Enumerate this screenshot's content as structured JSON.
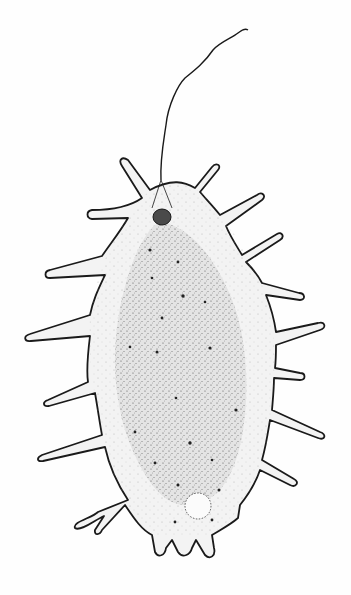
{
  "figure": {
    "colors": {
      "background": "#fefefe",
      "outline": "#1a1a1a",
      "cytoplasm": "#f2f2f2",
      "endoplasm": "#d9d9d9",
      "nucleus": "#4a4a4a"
    }
  }
}
